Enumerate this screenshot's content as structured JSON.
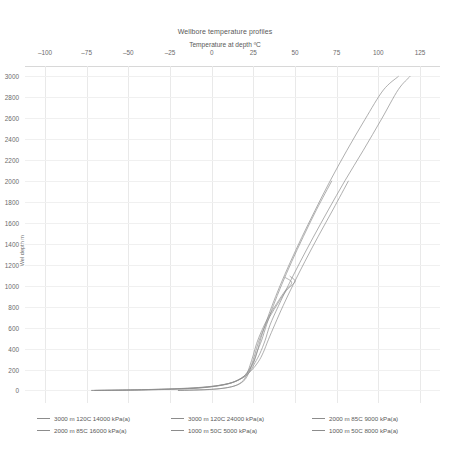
{
  "chart_data": {
    "type": "line",
    "title": "Wellbore temperature profiles",
    "subtitle": "Temperature at depth ºC",
    "xlabel": "Temperature at depth ºC",
    "ylabel": "Wel depth m",
    "xlim": [
      -112,
      137
    ],
    "ylim": [
      3100,
      -120
    ],
    "xticks": [
      -100,
      -75,
      -50,
      -25,
      0,
      25,
      50,
      75,
      100,
      125
    ],
    "yticks": [
      0,
      200,
      400,
      600,
      800,
      1000,
      1200,
      1400,
      1600,
      1800,
      2000,
      2200,
      2400,
      2600,
      2800,
      3000
    ],
    "grid": true,
    "legend_position": "bottom",
    "line_color": "#8c8c8c",
    "series": [
      {
        "name": "3000 m 120C 14000 kPa(a)",
        "points": [
          [
            -72,
            0
          ],
          [
            -40,
            5
          ],
          [
            -10,
            20
          ],
          [
            8,
            55
          ],
          [
            17,
            110
          ],
          [
            22,
            180
          ],
          [
            25,
            260
          ],
          [
            27,
            350
          ],
          [
            29,
            470
          ],
          [
            32,
            620
          ],
          [
            36,
            800
          ],
          [
            41,
            1000
          ],
          [
            47,
            1220
          ],
          [
            54,
            1460
          ],
          [
            62,
            1720
          ],
          [
            71,
            2000
          ],
          [
            81,
            2290
          ],
          [
            92,
            2590
          ],
          [
            103,
            2870
          ],
          [
            112,
            3000
          ]
        ]
      },
      {
        "name": "3000 m 120C 24000 kPa(a)",
        "points": [
          [
            -72,
            0
          ],
          [
            -40,
            6
          ],
          [
            -10,
            22
          ],
          [
            8,
            58
          ],
          [
            18,
            115
          ],
          [
            23,
            185
          ],
          [
            26,
            265
          ],
          [
            29,
            355
          ],
          [
            32,
            475
          ],
          [
            35,
            625
          ],
          [
            40,
            805
          ],
          [
            46,
            1005
          ],
          [
            53,
            1225
          ],
          [
            61,
            1465
          ],
          [
            70,
            1725
          ],
          [
            80,
            2005
          ],
          [
            91,
            2295
          ],
          [
            102,
            2595
          ],
          [
            112,
            2875
          ],
          [
            119,
            3000
          ]
        ]
      },
      {
        "name": "2000 m 85C 9000 kPa(a)",
        "points": [
          [
            -70,
            0
          ],
          [
            -38,
            8
          ],
          [
            -8,
            26
          ],
          [
            9,
            62
          ],
          [
            18,
            120
          ],
          [
            22,
            190
          ],
          [
            25,
            270
          ],
          [
            27,
            360
          ],
          [
            30,
            480
          ],
          [
            33,
            630
          ],
          [
            37,
            810
          ],
          [
            42,
            1010
          ],
          [
            48,
            1230
          ],
          [
            55,
            1470
          ],
          [
            63,
            1730
          ],
          [
            72,
            2000
          ]
        ]
      },
      {
        "name": "2000 m 85C 16000 kPa(a)",
        "points": [
          [
            -70,
            0
          ],
          [
            -38,
            9
          ],
          [
            -8,
            28
          ],
          [
            10,
            65
          ],
          [
            19,
            124
          ],
          [
            24,
            194
          ],
          [
            28,
            274
          ],
          [
            31,
            364
          ],
          [
            34,
            484
          ],
          [
            38,
            634
          ],
          [
            43,
            814
          ],
          [
            49,
            1014
          ],
          [
            56,
            1234
          ],
          [
            64,
            1474
          ],
          [
            73,
            1734
          ],
          [
            82,
            2000
          ]
        ]
      },
      {
        "name": "1000 m 50C 5000 kPa(a)",
        "points": [
          [
            -20,
            0
          ],
          [
            0,
            10
          ],
          [
            12,
            35
          ],
          [
            18,
            80
          ],
          [
            21,
            150
          ],
          [
            23,
            240
          ],
          [
            25,
            340
          ],
          [
            27,
            450
          ],
          [
            30,
            570
          ],
          [
            34,
            700
          ],
          [
            39,
            830
          ],
          [
            44,
            950
          ],
          [
            48,
            1030
          ],
          [
            44,
            1080
          ]
        ]
      },
      {
        "name": "1000 m 50C 8000 kPa(a)",
        "points": [
          [
            -20,
            0
          ],
          [
            1,
            12
          ],
          [
            13,
            40
          ],
          [
            19,
            88
          ],
          [
            22,
            158
          ],
          [
            24,
            248
          ],
          [
            26,
            348
          ],
          [
            28,
            458
          ],
          [
            31,
            578
          ],
          [
            35,
            708
          ],
          [
            40,
            838
          ],
          [
            45,
            958
          ],
          [
            50,
            1040
          ],
          [
            47,
            1090
          ]
        ]
      }
    ]
  },
  "legend": {
    "entries": [
      "3000 m 120C 14000 kPa(a)",
      "3000 m 120C 24000 kPa(a)",
      "2000 m 85C 9000 kPa(a)",
      "2000 m 85C 16000 kPa(a)",
      "1000 m 50C 5000 kPa(a)",
      "1000 m 50C 8000 kPa(a)"
    ]
  }
}
